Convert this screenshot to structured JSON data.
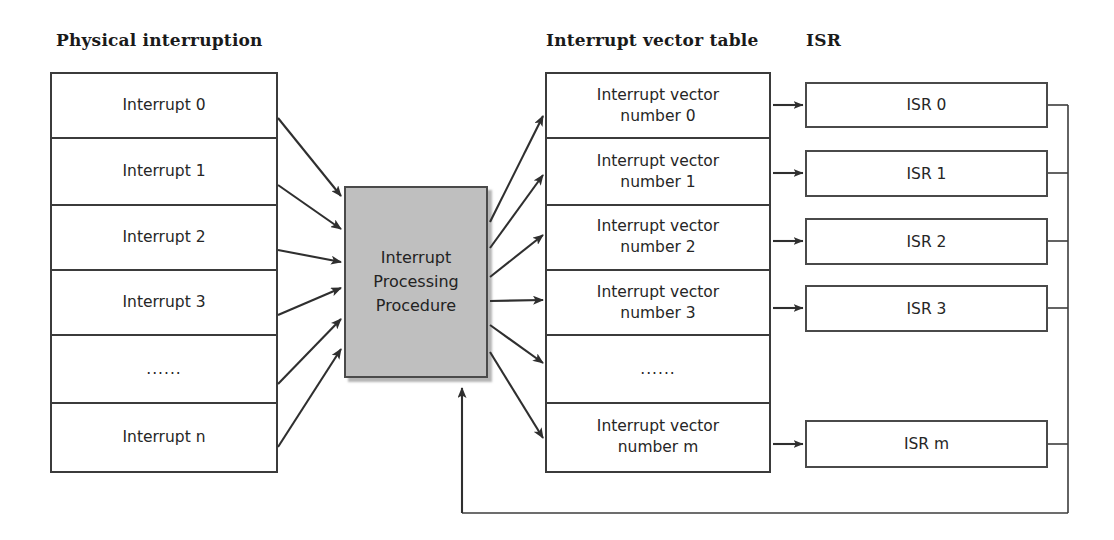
{
  "diagram": {
    "title_left": "Physical interruption",
    "title_middle": "Interrupt vector table",
    "title_right": "ISR",
    "colors": {
      "process_fill": "#bfbfbf",
      "line": "#3b3b3b",
      "text": "#262626",
      "background": "#ffffff"
    }
  },
  "physical_interruption": {
    "rows": [
      {
        "label": "Interrupt 0"
      },
      {
        "label": "Interrupt 1"
      },
      {
        "label": "Interrupt 2"
      },
      {
        "label": "Interrupt 3"
      },
      {
        "label": "......"
      },
      {
        "label": "Interrupt n"
      }
    ]
  },
  "process": {
    "label": "Interrupt\nProcessing\nProcedure"
  },
  "interrupt_vector_table": {
    "rows": [
      {
        "label": "Interrupt vector\nnumber 0"
      },
      {
        "label": "Interrupt vector\nnumber 1"
      },
      {
        "label": "Interrupt vector\nnumber 2"
      },
      {
        "label": "Interrupt vector\nnumber 3"
      },
      {
        "label": "......"
      },
      {
        "label": "Interrupt vector\nnumber m"
      }
    ]
  },
  "isr": {
    "boxes": [
      {
        "label": "ISR 0"
      },
      {
        "label": "ISR 1"
      },
      {
        "label": "ISR 2"
      },
      {
        "label": "ISR 3"
      },
      {
        "label": "ISR m"
      }
    ]
  }
}
